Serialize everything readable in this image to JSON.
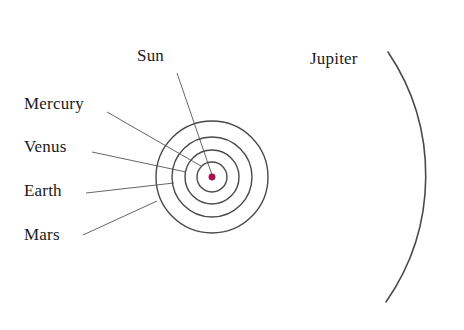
{
  "figure": {
    "type": "solar-system-orbit-diagram",
    "background_color": "#ffffff",
    "width": 464,
    "height": 330
  },
  "labels": {
    "sun": "Sun",
    "mercury": "Mercury",
    "venus": "Venus",
    "earth": "Earth",
    "mars": "Mars",
    "jupiter": "Jupiter"
  },
  "chart_data": {
    "type": "scatter",
    "title": "",
    "xlabel": "",
    "ylabel": "",
    "center": {
      "x": 212,
      "y": 177
    },
    "sun": {
      "name": "Sun",
      "marker": "filled-circle",
      "radius_px": 3.2,
      "color": "#b01050"
    },
    "orbits": [
      {
        "name": "Mercury",
        "radius_px": 15,
        "stroke": "#4a4a4a",
        "stroke_width": 1.4
      },
      {
        "name": "Venus",
        "radius_px": 27,
        "stroke": "#4a4a4a",
        "stroke_width": 1.4
      },
      {
        "name": "Earth",
        "radius_px": 40,
        "stroke": "#4a4a4a",
        "stroke_width": 1.4
      },
      {
        "name": "Mars",
        "radius_px": 56,
        "stroke": "#4a4a4a",
        "stroke_width": 1.4
      },
      {
        "name": "Jupiter",
        "radius_px": 221,
        "stroke": "#4a4a4a",
        "stroke_width": 1.6,
        "partial_arc": true
      }
    ],
    "leader_lines": [
      {
        "name": "Sun",
        "from": {
          "x": 177,
          "y": 73
        },
        "to": {
          "x": 212,
          "y": 175
        }
      },
      {
        "name": "Mercury",
        "from": {
          "x": 107,
          "y": 112
        },
        "to": {
          "x": 201,
          "y": 166
        }
      },
      {
        "name": "Venus",
        "from": {
          "x": 92,
          "y": 152
        },
        "to": {
          "x": 186,
          "y": 172
        }
      },
      {
        "name": "Earth",
        "from": {
          "x": 86,
          "y": 193
        },
        "to": {
          "x": 174,
          "y": 183
        }
      },
      {
        "name": "Mars",
        "from": {
          "x": 83,
          "y": 235
        },
        "to": {
          "x": 157,
          "y": 201
        }
      },
      {
        "name": "Jupiter",
        "from": {
          "x": 388,
          "y": 52
        },
        "to": {
          "x": 392,
          "y": 58
        }
      }
    ],
    "colors": {
      "orbit_stroke": "#4a4a4a",
      "leader_stroke": "#555555",
      "text": "#1a1a1a",
      "sun_marker": "#b01050",
      "background": "#ffffff"
    },
    "grid": false,
    "legend": "none"
  }
}
